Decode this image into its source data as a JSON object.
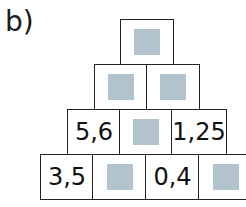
{
  "exercise_label": "b)",
  "colors": {
    "blank_fill": "#b3c3cd",
    "border": "#222222"
  },
  "pyramid": {
    "rows": [
      {
        "cells": [
          {
            "value": null
          }
        ]
      },
      {
        "cells": [
          {
            "value": null
          },
          {
            "value": null
          }
        ]
      },
      {
        "cells": [
          {
            "value": "5,6"
          },
          {
            "value": null
          },
          {
            "value": "1,25"
          }
        ]
      },
      {
        "cells": [
          {
            "value": "3,5"
          },
          {
            "value": null
          },
          {
            "value": "0,4"
          },
          {
            "value": null
          }
        ]
      }
    ]
  }
}
